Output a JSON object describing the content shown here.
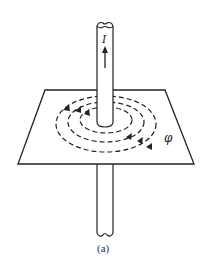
{
  "diagram": {
    "current_label": "I",
    "field_label": "φ",
    "caption": "(a)"
  }
}
